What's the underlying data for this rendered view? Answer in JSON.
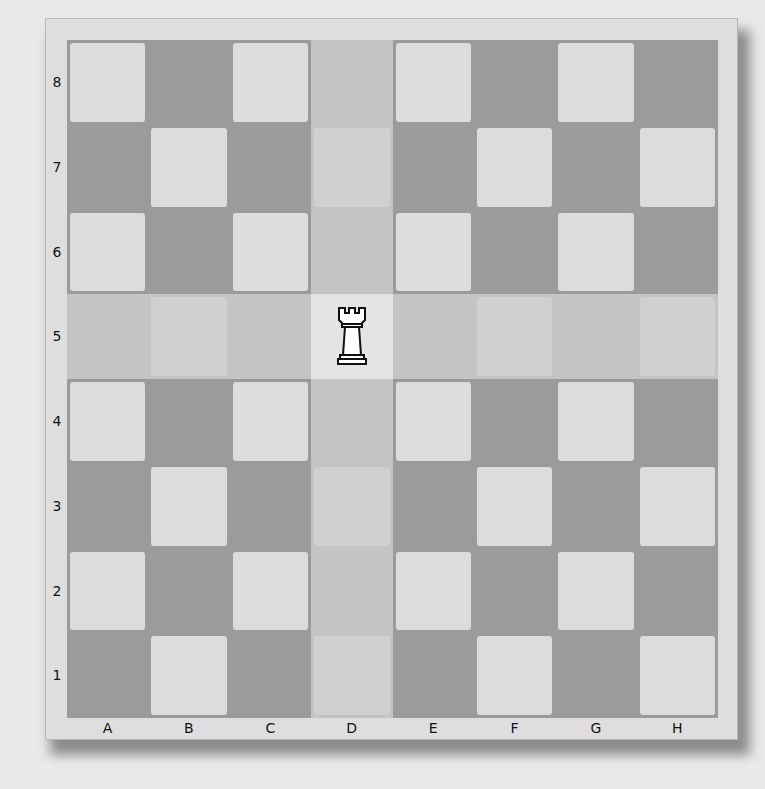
{
  "board": {
    "files": [
      "A",
      "B",
      "C",
      "D",
      "E",
      "F",
      "G",
      "H"
    ],
    "ranks": [
      "8",
      "7",
      "6",
      "5",
      "4",
      "3",
      "2",
      "1"
    ],
    "colors": {
      "dark": "#9b9b9b",
      "light": "#dcdcdc",
      "highlight_dark": "#c4c4c4",
      "highlight_light": "#d0d0d0",
      "origin": "#e4e4e4"
    },
    "piece": {
      "type": "rook",
      "color": "white",
      "square": "D5",
      "icon": "rook-icon"
    },
    "highlighted": {
      "file": "D",
      "rank": "5",
      "meaning": "rook movement lines"
    }
  }
}
